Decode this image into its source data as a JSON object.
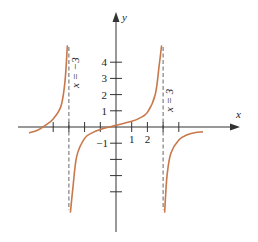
{
  "figure": {
    "axes": {
      "x_label": "x",
      "y_label": "y",
      "x_tick_labels": [
        {
          "value": -1,
          "text": "−1"
        },
        {
          "value": 1,
          "text": "1"
        },
        {
          "value": 2,
          "text": "2"
        }
      ],
      "y_tick_labels": [
        {
          "value": 1,
          "text": "1"
        },
        {
          "value": 2,
          "text": "2"
        },
        {
          "value": 3,
          "text": "3"
        },
        {
          "value": 4,
          "text": "4"
        }
      ],
      "x_ticks": [
        -4,
        -3,
        -2,
        -1,
        1,
        2,
        3,
        4
      ],
      "y_ticks": [
        -4,
        -3,
        -2,
        -1,
        1,
        2,
        3,
        4
      ]
    },
    "asymptotes": [
      {
        "x": -3,
        "label": "x = −3"
      },
      {
        "x": 3,
        "label": "x = 3"
      }
    ],
    "colors": {
      "curve": "#c8784a",
      "axis": "#333333",
      "asymptote": "#666666",
      "background": "#ffffff"
    }
  },
  "chart_data": {
    "type": "line",
    "title": "",
    "xlabel": "x",
    "ylabel": "y",
    "xlim": [
      -5.6,
      7.8
    ],
    "ylim": [
      -6.6,
      7.1
    ],
    "grid": false,
    "vertical_asymptotes": [
      -3,
      3
    ],
    "annotations": [
      "x = −3",
      "x = 3"
    ],
    "series": [
      {
        "name": "left branch (x < -3)",
        "x": [
          -5.5,
          -5,
          -4.5,
          -4,
          -3.5,
          -3.25,
          -3.1
        ],
        "y": [
          -0.35,
          -0.2,
          0.1,
          0.5,
          1.3,
          2.8,
          5.3
        ]
      },
      {
        "name": "middle branch (-3 < x < 3)",
        "x": [
          -2.9,
          -2.75,
          -2.5,
          -2,
          -1.5,
          -1,
          0,
          1,
          1.5,
          2,
          2.5,
          2.75,
          2.9
        ],
        "y": [
          -7.4,
          -3.8,
          -1.8,
          -0.7,
          -0.35,
          -0.15,
          0.1,
          0.35,
          0.55,
          0.9,
          2.0,
          3.8,
          7.4
        ]
      },
      {
        "name": "right branch (x > 3)",
        "x": [
          3.1,
          3.25,
          3.5,
          4,
          4.5,
          5,
          5.5
        ],
        "y": [
          -7.4,
          -3.0,
          -1.6,
          -0.8,
          -0.5,
          -0.35,
          -0.3
        ]
      }
    ]
  }
}
